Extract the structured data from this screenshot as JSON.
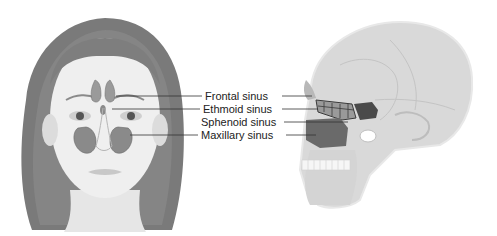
{
  "diagram": {
    "views": [
      {
        "name": "front-face",
        "description": "Frontal view of face showing sinus locations"
      },
      {
        "name": "side-skull",
        "description": "Lateral view of skull showing sinus cavities"
      }
    ],
    "labels": [
      {
        "id": "frontal",
        "text": "Frontal sinus"
      },
      {
        "id": "ethmoid",
        "text": "Ethmoid sinus"
      },
      {
        "id": "sphenoid",
        "text": "Sphenoid sinus"
      },
      {
        "id": "maxillary",
        "text": "Maxillary sinus"
      }
    ],
    "colors": {
      "sinus_face": "#8a8a8a",
      "sinus_dark": "#4a4a4a",
      "skull": "#d8d8d8",
      "hair": "#6e6e6e",
      "skin": "#ececec",
      "leader_line": "#333333"
    }
  }
}
